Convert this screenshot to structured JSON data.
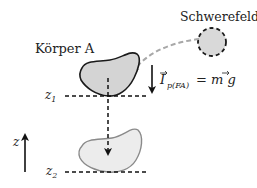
{
  "diagram": {
    "labels": {
      "body": "Körper A",
      "field": "Schwerefeld",
      "z_axis": "z",
      "z1_main": "z",
      "z1_sub": "1",
      "z2_main": "z",
      "z2_sub": "2",
      "force_main": "I",
      "force_sub": "p(FA)",
      "force_rhs": "= m g"
    },
    "colors": {
      "body_upper_fill": "#d4d4d4",
      "body_upper_stroke": "#1a1a1a",
      "body_lower_fill": "#ececec",
      "body_lower_stroke": "#8a8a8a",
      "field_fill": "#d9d9d9",
      "field_stroke": "#1a1a1a",
      "field_link": "#a8a8a8",
      "lines": "#111111"
    }
  }
}
